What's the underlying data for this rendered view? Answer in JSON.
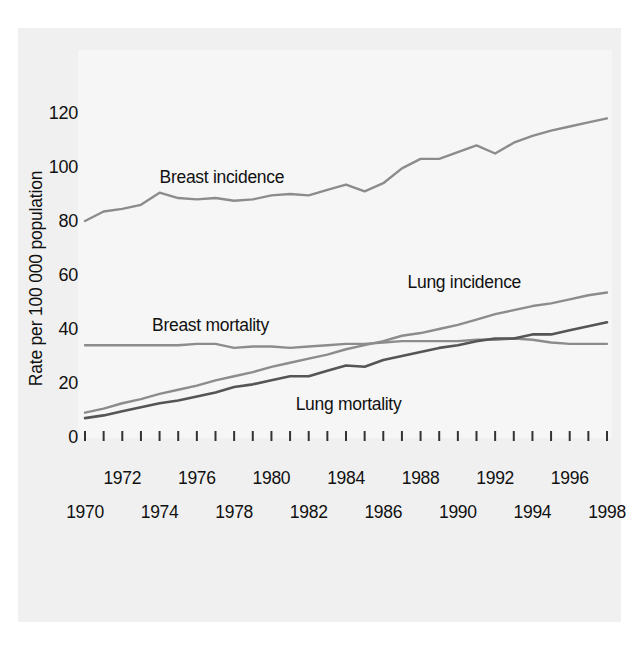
{
  "chart_data": {
    "type": "line",
    "title": "",
    "subtitle": "",
    "xlabel": "",
    "ylabel": "Rate per 100 000 population",
    "ylim": [
      0,
      130
    ],
    "xlim": [
      1970,
      1998
    ],
    "yticks": [
      0,
      20,
      40,
      60,
      80,
      100,
      120
    ],
    "ytick_labels": [
      "0",
      "20",
      "40",
      "60",
      "80",
      "100",
      "120"
    ],
    "x": [
      1970,
      1971,
      1972,
      1973,
      1974,
      1975,
      1976,
      1977,
      1978,
      1979,
      1980,
      1981,
      1982,
      1983,
      1984,
      1985,
      1986,
      1987,
      1988,
      1989,
      1990,
      1991,
      1992,
      1993,
      1994,
      1995,
      1996,
      1997,
      1998
    ],
    "xtick_labels_upper": [
      "1972",
      "1976",
      "1980",
      "1984",
      "1988",
      "1992",
      "1996"
    ],
    "xtick_labels_lower": [
      "1970",
      "1974",
      "1978",
      "1982",
      "1986",
      "1990",
      "1994",
      "1998"
    ],
    "grid": false,
    "legend_position": "inline-annotations",
    "series": [
      {
        "name": "Breast incidence",
        "color": "#8c8c8c",
        "label_x": 1974.0,
        "label_y": 96,
        "values": [
          80.0,
          83.5,
          84.5,
          86.0,
          90.5,
          88.5,
          88.0,
          88.5,
          87.5,
          88.0,
          89.5,
          90.0,
          89.5,
          91.5,
          93.5,
          91.0,
          94.0,
          99.5,
          103.0,
          103.0,
          105.5,
          108.0,
          105.0,
          109.0,
          111.5,
          113.5,
          115.0,
          116.5,
          118.0
        ]
      },
      {
        "name": "Breast mortality",
        "color": "#8c8c8c",
        "label_x": 1973.6,
        "label_y": 41,
        "values": [
          34.0,
          34.0,
          34.0,
          34.0,
          34.0,
          34.0,
          34.5,
          34.5,
          33.0,
          33.5,
          33.5,
          33.0,
          33.5,
          34.0,
          34.5,
          34.5,
          35.0,
          35.5,
          35.5,
          35.5,
          35.5,
          36.0,
          36.0,
          36.5,
          36.0,
          35.0,
          34.5,
          34.5,
          34.5
        ]
      },
      {
        "name": "Lung incidence",
        "color": "#8c8c8c",
        "label_x": 1987.3,
        "label_y": 57,
        "values": [
          9.0,
          10.5,
          12.5,
          14.0,
          16.0,
          17.5,
          19.0,
          21.0,
          22.5,
          24.0,
          26.0,
          27.5,
          29.0,
          30.5,
          32.5,
          34.0,
          35.5,
          37.5,
          38.5,
          40.0,
          41.5,
          43.5,
          45.5,
          47.0,
          48.5,
          49.5,
          51.0,
          52.5,
          53.5
        ]
      },
      {
        "name": "Lung mortality",
        "color": "#555555",
        "label_x": 1981.3,
        "label_y": 12,
        "values": [
          7.0,
          8.0,
          9.5,
          11.0,
          12.5,
          13.5,
          15.0,
          16.5,
          18.5,
          19.5,
          21.0,
          22.5,
          22.5,
          24.5,
          26.5,
          26.0,
          28.5,
          30.0,
          31.5,
          33.0,
          34.0,
          35.5,
          36.5,
          36.5,
          38.0,
          38.0,
          39.5,
          41.0,
          42.5
        ]
      }
    ]
  }
}
